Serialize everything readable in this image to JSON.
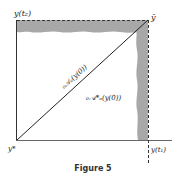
{
  "figure": {
    "caption": "Figure 5",
    "labels": {
      "top_left": "y(t₂)",
      "top_right": "ȳ",
      "bottom_left": "y*",
      "bottom_right": "y(t₁)",
      "diagonal_label": "₀𝒜ₐ(y(0))",
      "lower_label": "₀𝒜*ₐ(y(0))"
    },
    "colors": {
      "shaded_band": "#a8a8a8",
      "lines": "#333333"
    }
  }
}
